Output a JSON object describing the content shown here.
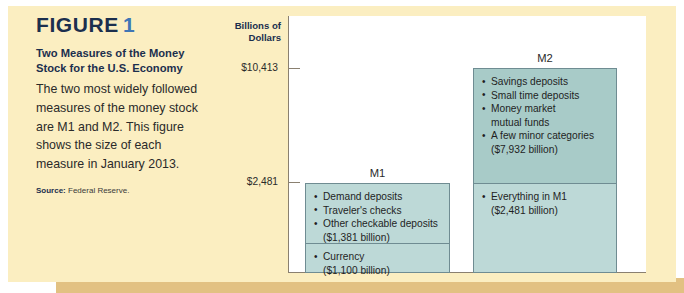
{
  "figure": {
    "label": "FIGURE",
    "number": "1",
    "subtitle": "Two Measures of the Money Stock for the U.S. Economy",
    "body": "The two most widely followed measures of the money stock are M1 and M2. This figure shows the size of each measure in January 2013.",
    "source_label": "Source:",
    "source_text": "Federal Reserve."
  },
  "chart_data": {
    "type": "bar",
    "title": "Two Measures of the Money Stock for the U.S. Economy",
    "xlabel": "",
    "ylabel": "Billions of Dollars",
    "ylim": [
      0,
      10413
    ],
    "grid": false,
    "legend": "none",
    "tick_labels": [
      "$10,413",
      "$2,481"
    ],
    "tick_values": [
      10413,
      2481
    ],
    "categories": [
      "M1",
      "M2"
    ],
    "values": [
      2481,
      10413
    ],
    "series": [
      {
        "name": "Currency",
        "values": [
          1100,
          2481
        ]
      },
      {
        "name": "Other components",
        "values": [
          1381,
          7932
        ]
      }
    ],
    "bars": [
      {
        "name": "M1",
        "label": "M1",
        "total": 2481,
        "segments": [
          {
            "name": "m1-deposits",
            "value": 1381,
            "items": [
              "Demand deposits",
              "Traveler's checks",
              "Other checkable deposits"
            ],
            "amount": "($1,381 billion)"
          },
          {
            "name": "m1-currency",
            "value": 1100,
            "items": [
              "Currency"
            ],
            "amount": "($1,100 billion)"
          }
        ]
      },
      {
        "name": "M2",
        "label": "M2",
        "total": 10413,
        "segments": [
          {
            "name": "m2-other",
            "value": 7932,
            "items": [
              "Savings deposits",
              "Small time deposits",
              "Money market\n mutual funds",
              "A few minor categories"
            ],
            "amount": "($7,932 billion)"
          },
          {
            "name": "m2-m1",
            "value": 2481,
            "items": [
              "Everything in M1"
            ],
            "amount": "($2,481 billion)"
          }
        ]
      }
    ]
  },
  "colors": {
    "panel_bg": "#fbeec1",
    "panel_shadow": "#e2c182",
    "plot_bg": "#ffffff",
    "bar_fill": "#bdd9d7",
    "bar_fill_dark": "#a8cbc8",
    "bar_border": "#6f8c92",
    "axis": "#8a8070",
    "title_navy": "#1b2f4e",
    "title_blue": "#3f76b5"
  }
}
